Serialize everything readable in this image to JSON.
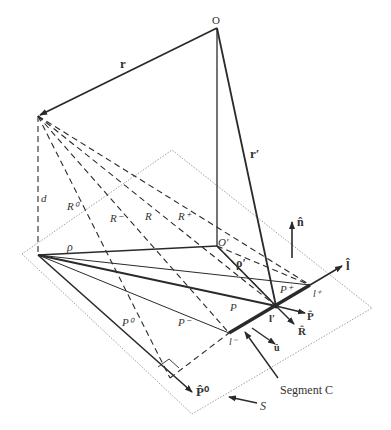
{
  "labels": {
    "O": "O",
    "O_prime": "O′",
    "r": "r",
    "r_prime": "r′",
    "d": "d",
    "R0": "R⁰",
    "R_minus": "R⁻",
    "R": "R",
    "R_plus": "R⁺",
    "rho": "ρ",
    "rho_prime": "ρ′",
    "P0": "P⁰",
    "P_minus": "P⁻",
    "P": "P",
    "P_plus": "P⁺",
    "n_hat": "n̂",
    "l_hat": "l̂",
    "P_hat": "P̂",
    "R_hat": "R̂",
    "u_hat": "û",
    "P0_hat": "P̂⁰",
    "l_prime": "l′",
    "l_plus": "l⁺",
    "l_minus": "l⁻",
    "segment_C": "Segment C",
    "S": "S"
  },
  "colors": {
    "line": "#2a2a2a",
    "plane": "#888888",
    "text": "#333333"
  }
}
